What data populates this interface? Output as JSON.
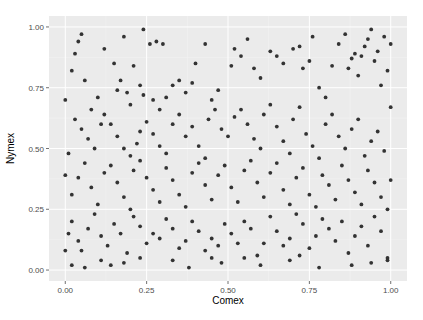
{
  "chart_data": {
    "type": "scatter",
    "title": "",
    "xlabel": "Comex",
    "ylabel": "Nymex",
    "xlim": [
      -0.05,
      1.05
    ],
    "ylim": [
      -0.045,
      1.045
    ],
    "xticks": [
      0.0,
      0.25,
      0.5,
      0.75,
      1.0
    ],
    "xtick_labels": [
      "0.00",
      "0.25",
      "0.50",
      "0.75",
      "1.00"
    ],
    "yticks": [
      0.0,
      0.25,
      0.5,
      0.75,
      1.0
    ],
    "ytick_labels": [
      "0.00",
      "0.25",
      "0.50",
      "0.75",
      "1.00"
    ],
    "grid": true,
    "legend": "none",
    "theme": {
      "panel_bg": "#EBEBEB",
      "grid_major": "#FFFFFF",
      "grid_minor": "#F5F5F5",
      "point_color": "#333333",
      "tick_color": "#4D4D4D"
    },
    "points": [
      [
        0.03,
        0.89
      ],
      [
        0.04,
        0.94
      ],
      [
        0.02,
        0.82
      ],
      [
        0.06,
        0.78
      ],
      [
        0.05,
        0.97
      ],
      [
        0.12,
        0.91
      ],
      [
        0.15,
        0.85
      ],
      [
        0.18,
        0.96
      ],
      [
        0.21,
        0.84
      ],
      [
        0.24,
        0.99
      ],
      [
        0.26,
        0.93
      ],
      [
        0.28,
        0.94
      ],
      [
        0.3,
        0.93
      ],
      [
        0.08,
        0.66
      ],
      [
        0.1,
        0.71
      ],
      [
        0.11,
        0.6
      ],
      [
        0.16,
        0.74
      ],
      [
        0.17,
        0.78
      ],
      [
        0.19,
        0.73
      ],
      [
        0.2,
        0.68
      ],
      [
        0.23,
        0.76
      ],
      [
        0.24,
        0.72
      ],
      [
        0.27,
        0.7
      ],
      [
        0.29,
        0.66
      ],
      [
        0.31,
        0.71
      ],
      [
        0.33,
        0.76
      ],
      [
        0.35,
        0.78
      ],
      [
        0.37,
        0.73
      ],
      [
        0.39,
        0.77
      ],
      [
        0.4,
        0.85
      ],
      [
        0.43,
        0.93
      ],
      [
        0.45,
        0.7
      ],
      [
        0.47,
        0.74
      ],
      [
        0.51,
        0.84
      ],
      [
        0.52,
        0.91
      ],
      [
        0.54,
        0.88
      ],
      [
        0.56,
        0.95
      ],
      [
        0.58,
        0.83
      ],
      [
        0.6,
        0.79
      ],
      [
        0.63,
        0.9
      ],
      [
        0.65,
        0.88
      ],
      [
        0.67,
        0.85
      ],
      [
        0.7,
        0.91
      ],
      [
        0.72,
        0.92
      ],
      [
        0.73,
        0.83
      ],
      [
        0.75,
        0.86
      ],
      [
        0.76,
        0.96
      ],
      [
        0.78,
        0.75
      ],
      [
        0.8,
        0.71
      ],
      [
        0.82,
        0.84
      ],
      [
        0.84,
        0.93
      ],
      [
        0.86,
        0.97
      ],
      [
        0.87,
        0.83
      ],
      [
        0.88,
        0.87
      ],
      [
        0.89,
        0.89
      ],
      [
        0.9,
        0.8
      ],
      [
        0.91,
        0.88
      ],
      [
        0.92,
        0.92
      ],
      [
        0.93,
        0.95
      ],
      [
        0.94,
        0.99
      ],
      [
        0.95,
        0.86
      ],
      [
        0.96,
        0.9
      ],
      [
        0.97,
        0.76
      ],
      [
        0.98,
        0.96
      ],
      [
        0.99,
        0.82
      ],
      [
        0.03,
        0.62
      ],
      [
        0.05,
        0.58
      ],
      [
        0.07,
        0.54
      ],
      [
        0.09,
        0.5
      ],
      [
        0.12,
        0.64
      ],
      [
        0.14,
        0.6
      ],
      [
        0.16,
        0.55
      ],
      [
        0.18,
        0.5
      ],
      [
        0.2,
        0.47
      ],
      [
        0.22,
        0.52
      ],
      [
        0.23,
        0.57
      ],
      [
        0.25,
        0.61
      ],
      [
        0.27,
        0.56
      ],
      [
        0.29,
        0.51
      ],
      [
        0.31,
        0.48
      ],
      [
        0.33,
        0.6
      ],
      [
        0.35,
        0.64
      ],
      [
        0.37,
        0.55
      ],
      [
        0.39,
        0.59
      ],
      [
        0.41,
        0.51
      ],
      [
        0.43,
        0.46
      ],
      [
        0.44,
        0.62
      ],
      [
        0.46,
        0.66
      ],
      [
        0.48,
        0.58
      ],
      [
        0.5,
        0.55
      ],
      [
        0.52,
        0.63
      ],
      [
        0.54,
        0.66
      ],
      [
        0.56,
        0.6
      ],
      [
        0.58,
        0.54
      ],
      [
        0.6,
        0.5
      ],
      [
        0.61,
        0.64
      ],
      [
        0.63,
        0.68
      ],
      [
        0.65,
        0.59
      ],
      [
        0.67,
        0.53
      ],
      [
        0.69,
        0.48
      ],
      [
        0.7,
        0.62
      ],
      [
        0.72,
        0.67
      ],
      [
        0.74,
        0.56
      ],
      [
        0.76,
        0.51
      ],
      [
        0.78,
        0.46
      ],
      [
        0.8,
        0.6
      ],
      [
        0.82,
        0.64
      ],
      [
        0.84,
        0.55
      ],
      [
        0.86,
        0.5
      ],
      [
        0.88,
        0.58
      ],
      [
        0.9,
        0.62
      ],
      [
        0.92,
        0.47
      ],
      [
        0.94,
        0.53
      ],
      [
        0.96,
        0.57
      ],
      [
        0.98,
        0.49
      ],
      [
        0.02,
        0.31
      ],
      [
        0.04,
        0.38
      ],
      [
        0.06,
        0.44
      ],
      [
        0.08,
        0.34
      ],
      [
        0.1,
        0.27
      ],
      [
        0.12,
        0.4
      ],
      [
        0.14,
        0.43
      ],
      [
        0.16,
        0.36
      ],
      [
        0.18,
        0.3
      ],
      [
        0.2,
        0.25
      ],
      [
        0.21,
        0.41
      ],
      [
        0.23,
        0.45
      ],
      [
        0.25,
        0.38
      ],
      [
        0.27,
        0.33
      ],
      [
        0.29,
        0.28
      ],
      [
        0.31,
        0.42
      ],
      [
        0.33,
        0.37
      ],
      [
        0.35,
        0.31
      ],
      [
        0.37,
        0.26
      ],
      [
        0.39,
        0.4
      ],
      [
        0.41,
        0.44
      ],
      [
        0.43,
        0.35
      ],
      [
        0.45,
        0.29
      ],
      [
        0.47,
        0.39
      ],
      [
        0.49,
        0.43
      ],
      [
        0.51,
        0.34
      ],
      [
        0.53,
        0.28
      ],
      [
        0.55,
        0.41
      ],
      [
        0.57,
        0.45
      ],
      [
        0.59,
        0.36
      ],
      [
        0.61,
        0.3
      ],
      [
        0.63,
        0.4
      ],
      [
        0.65,
        0.44
      ],
      [
        0.67,
        0.33
      ],
      [
        0.69,
        0.27
      ],
      [
        0.71,
        0.38
      ],
      [
        0.73,
        0.42
      ],
      [
        0.75,
        0.31
      ],
      [
        0.77,
        0.26
      ],
      [
        0.79,
        0.39
      ],
      [
        0.81,
        0.35
      ],
      [
        0.83,
        0.29
      ],
      [
        0.85,
        0.43
      ],
      [
        0.87,
        0.37
      ],
      [
        0.89,
        0.32
      ],
      [
        0.91,
        0.27
      ],
      [
        0.93,
        0.41
      ],
      [
        0.95,
        0.36
      ],
      [
        0.97,
        0.3
      ],
      [
        0.99,
        0.25
      ],
      [
        0.02,
        0.2
      ],
      [
        0.04,
        0.12
      ],
      [
        0.05,
        0.08
      ],
      [
        0.07,
        0.17
      ],
      [
        0.09,
        0.23
      ],
      [
        0.11,
        0.14
      ],
      [
        0.13,
        0.1
      ],
      [
        0.15,
        0.19
      ],
      [
        0.17,
        0.15
      ],
      [
        0.19,
        0.07
      ],
      [
        0.21,
        0.22
      ],
      [
        0.23,
        0.18
      ],
      [
        0.25,
        0.11
      ],
      [
        0.27,
        0.15
      ],
      [
        0.29,
        0.13
      ],
      [
        0.31,
        0.21
      ],
      [
        0.33,
        0.17
      ],
      [
        0.35,
        0.09
      ],
      [
        0.37,
        0.12
      ],
      [
        0.39,
        0.2
      ],
      [
        0.41,
        0.16
      ],
      [
        0.43,
        0.08
      ],
      [
        0.45,
        0.13
      ],
      [
        0.47,
        0.1
      ],
      [
        0.49,
        0.19
      ],
      [
        0.51,
        0.15
      ],
      [
        0.53,
        0.11
      ],
      [
        0.55,
        0.2
      ],
      [
        0.57,
        0.17
      ],
      [
        0.59,
        0.06
      ],
      [
        0.61,
        0.11
      ],
      [
        0.63,
        0.22
      ],
      [
        0.65,
        0.16
      ],
      [
        0.67,
        0.1
      ],
      [
        0.69,
        0.13
      ],
      [
        0.71,
        0.23
      ],
      [
        0.73,
        0.19
      ],
      [
        0.75,
        0.09
      ],
      [
        0.77,
        0.14
      ],
      [
        0.79,
        0.21
      ],
      [
        0.81,
        0.17
      ],
      [
        0.83,
        0.12
      ],
      [
        0.85,
        0.2
      ],
      [
        0.87,
        0.07
      ],
      [
        0.89,
        0.14
      ],
      [
        0.91,
        0.18
      ],
      [
        0.93,
        0.1
      ],
      [
        0.95,
        0.22
      ],
      [
        0.97,
        0.16
      ],
      [
        0.02,
        0.02
      ],
      [
        0.06,
        0.01
      ],
      [
        0.11,
        0.04
      ],
      [
        0.14,
        0.02
      ],
      [
        0.18,
        0.03
      ],
      [
        0.23,
        0.05
      ],
      [
        0.33,
        0.04
      ],
      [
        0.38,
        0.01
      ],
      [
        0.45,
        0.05
      ],
      [
        0.48,
        0.03
      ],
      [
        0.55,
        0.05
      ],
      [
        0.6,
        0.02
      ],
      [
        0.69,
        0.04
      ],
      [
        0.72,
        0.06
      ],
      [
        0.78,
        0.01
      ],
      [
        0.88,
        0.02
      ],
      [
        0.94,
        0.03
      ],
      [
        0.99,
        0.05
      ],
      [
        0.99,
        0.04
      ],
      [
        0.0,
        0.08
      ],
      [
        0.01,
        0.15
      ],
      [
        0.0,
        0.39
      ],
      [
        0.0,
        0.7
      ],
      [
        0.01,
        0.48
      ],
      [
        1.0,
        0.37
      ],
      [
        1.0,
        0.67
      ],
      [
        1.0,
        0.93
      ]
    ]
  }
}
